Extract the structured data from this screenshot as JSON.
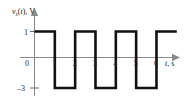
{
  "figure": {
    "name": "square-wave-voltage-plot",
    "background_color": "#ffffff",
    "waveform_color": "#111111",
    "axis_color": "#8a8a8a",
    "text_color": "#1a1a1a"
  },
  "axes": {
    "y_axis": {
      "label_prefix": "v",
      "label_subscript": "s",
      "label_arg": "(t), V",
      "full_label": "vs(t), V",
      "tick_labels": [
        "1",
        "–3"
      ],
      "tick_values": [
        1,
        -3
      ]
    },
    "x_axis": {
      "label_italic": "t",
      "label_rest": ", s",
      "full_label": "t, s",
      "origin_label": "0",
      "tick_labels": [
        "1",
        "2",
        "3",
        "4",
        "5",
        "6"
      ],
      "tick_values": [
        1,
        2,
        3,
        4,
        5,
        6
      ]
    }
  },
  "chart_data": {
    "type": "line",
    "title": "",
    "xlabel": "t, s",
    "ylabel": "vs(t), V",
    "xlim": [
      0,
      7
    ],
    "ylim": [
      -3,
      1
    ],
    "grid": false,
    "legend": "none",
    "waveform": "square",
    "period": 2,
    "high_value": 1,
    "low_value": -3,
    "duty_cycle": 0.5,
    "x": [
      0,
      1,
      1,
      2,
      2,
      3,
      3,
      4,
      4,
      5,
      5,
      6,
      6,
      7
    ],
    "y": [
      1,
      1,
      -3,
      -3,
      1,
      1,
      -3,
      -3,
      1,
      1,
      -3,
      -3,
      1,
      1
    ],
    "segments": [
      {
        "t_start": 0,
        "t_end": 1,
        "value": 1
      },
      {
        "t_start": 1,
        "t_end": 2,
        "value": -3
      },
      {
        "t_start": 2,
        "t_end": 3,
        "value": 1
      },
      {
        "t_start": 3,
        "t_end": 4,
        "value": -3
      },
      {
        "t_start": 4,
        "t_end": 5,
        "value": 1
      },
      {
        "t_start": 5,
        "t_end": 6,
        "value": -3
      },
      {
        "t_start": 6,
        "t_end": 7,
        "value": 1
      }
    ]
  }
}
